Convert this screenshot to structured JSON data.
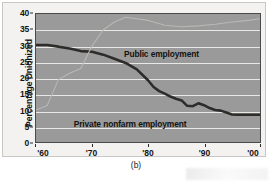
{
  "figure": {
    "caption": "(b)",
    "panel_label": "(b)"
  },
  "chart_data": {
    "type": "line",
    "title": "",
    "subtitle": "",
    "xlabel": "",
    "ylabel": "Percentage Unionized",
    "xlim": [
      1960,
      2000
    ],
    "ylim": [
      0,
      40
    ],
    "grid": true,
    "legend_position": "in-plot annotations",
    "x_tick_labels": [
      "'60",
      "'70",
      "'80",
      "'90",
      "'00"
    ],
    "x_tick_values": [
      1960,
      1970,
      1980,
      1990,
      2000
    ],
    "y_tick_labels": [
      "0",
      "5",
      "10",
      "15",
      "20",
      "25",
      "30",
      "35",
      "40"
    ],
    "y_tick_values": [
      0,
      5,
      10,
      15,
      20,
      25,
      30,
      35,
      40
    ],
    "annotations": [
      {
        "text": "Public employment",
        "x": 1982,
        "y": 29
      },
      {
        "text": "Private nonfarm employment",
        "x": 1977,
        "y": 11
      }
    ],
    "series": [
      {
        "name": "Private nonfarm employment",
        "color": "#2e2c2a",
        "style": "thick-solid",
        "x": [
          1960,
          1962,
          1964,
          1966,
          1968,
          1970,
          1972,
          1974,
          1976,
          1978,
          1980,
          1981,
          1982,
          1983,
          1984,
          1985,
          1986,
          1987,
          1988,
          1989,
          1990,
          1991,
          1992,
          1993,
          1994,
          1995,
          1996,
          1997,
          1998,
          2000
        ],
        "values": [
          30.3,
          30.3,
          29.8,
          29.2,
          28.4,
          28.2,
          27.3,
          26.0,
          24.7,
          22.7,
          19.3,
          17.2,
          15.9,
          15.1,
          14.2,
          13.5,
          13.0,
          11.3,
          11.2,
          12.1,
          11.5,
          10.6,
          10.0,
          9.8,
          9.2,
          8.6,
          8.5,
          8.5,
          8.5,
          8.5
        ]
      },
      {
        "name": "Public employment",
        "color": "#b9b8b4",
        "style": "thin-solid",
        "x": [
          1960,
          1962,
          1964,
          1966,
          1968,
          1970,
          1972,
          1974,
          1976,
          1978,
          1980,
          1983,
          1986,
          1989,
          1992,
          1995,
          1998,
          2000
        ],
        "values": [
          10.0,
          11.4,
          19.5,
          21.5,
          23.0,
          30.0,
          35.0,
          37.5,
          39.0,
          38.5,
          38.0,
          36.5,
          36.0,
          36.3,
          36.8,
          37.5,
          38.0,
          38.5
        ]
      }
    ]
  }
}
